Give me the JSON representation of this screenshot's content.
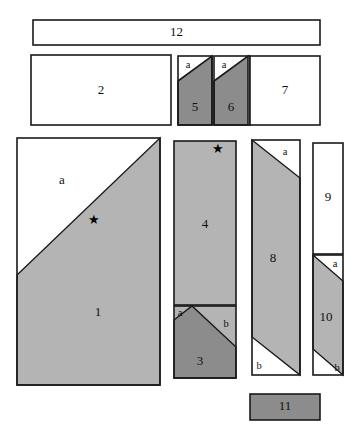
{
  "figure": {
    "background_color": "#ffffff",
    "stroke_color": "#1a1a1a",
    "fill_light": "#ffffff",
    "fill_gray": "#b4b4b4",
    "fill_dark_gray": "#8c8c8c",
    "star_color": "#000000"
  },
  "pieces": [
    {
      "id": "p12",
      "label": "12",
      "shade": "light"
    },
    {
      "id": "p2",
      "label": "2",
      "shade": "light"
    },
    {
      "id": "p5",
      "label": "5",
      "shade": "dark"
    },
    {
      "id": "p6",
      "label": "6",
      "shade": "dark"
    },
    {
      "id": "p7",
      "label": "7",
      "shade": "light"
    },
    {
      "id": "p1",
      "label": "1",
      "shade": "gray"
    },
    {
      "id": "p4",
      "label": "4",
      "shade": "gray"
    },
    {
      "id": "p3",
      "label": "3",
      "shade": "dark"
    },
    {
      "id": "p8",
      "label": "8",
      "shade": "gray"
    },
    {
      "id": "p9",
      "label": "9",
      "shade": "light"
    },
    {
      "id": "p10",
      "label": "10",
      "shade": "gray"
    },
    {
      "id": "p11",
      "label": "11",
      "shade": "dark"
    }
  ],
  "corner_labels": {
    "a5": "a",
    "a6": "a",
    "a1": "a",
    "a3": "a",
    "b3": "b",
    "a8": "a",
    "b8": "b",
    "a10": "a",
    "b10": "b"
  },
  "markers": {
    "star_piece_1": "★",
    "star_piece_4": "★"
  }
}
